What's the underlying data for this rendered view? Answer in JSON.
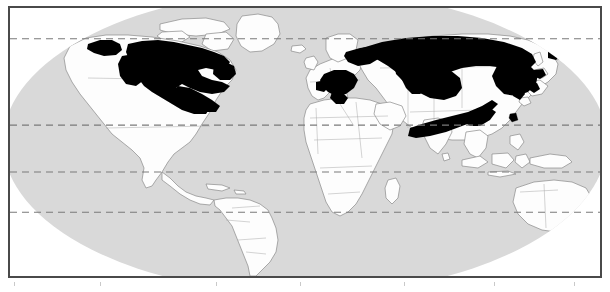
{
  "figure": {
    "kind": "world-distribution-map",
    "projection": "Robinson-like pseudocylindrical ellipse",
    "width_px": 610,
    "height_px": 292
  },
  "colors": {
    "frame_border": "#4a4a4a",
    "ocean_fill": "#d9d9d9",
    "land_fill": "#fdfdfd",
    "land_outline": "#8a8a8a",
    "country_outline": "#a8a8a8",
    "range_fill": "#000000",
    "graticule": "#7a7a7a",
    "page_background": "#ffffff",
    "tick_mark": "#c9c9c9"
  },
  "legend": {
    "range_label": "Distribution range",
    "range_swatch_color": "#000000",
    "land_label": "Land",
    "ocean_label": "Ocean"
  },
  "graticule": {
    "style": "dashed",
    "latitude_lines": [
      {
        "name": "Arctic Circle",
        "y_ratio": 0.115
      },
      {
        "name": "Tropic of Cancer",
        "y_ratio": 0.437
      },
      {
        "name": "Equator",
        "y_ratio": 0.612
      },
      {
        "name": "Tropic of Capricorn",
        "y_ratio": 0.762
      }
    ]
  },
  "range_regions": [
    {
      "name": "Alaska",
      "continent": "North America",
      "present": true
    },
    {
      "name": "Yukon and Northwest Territories",
      "continent": "North America",
      "present": true
    },
    {
      "name": "Boreal Canada",
      "continent": "North America",
      "present": true
    },
    {
      "name": "Eastern Canada and Labrador",
      "continent": "North America",
      "present": true
    },
    {
      "name": "Great Lakes region",
      "continent": "North America",
      "present": true
    },
    {
      "name": "Alps and Carpathians",
      "continent": "Europe",
      "present": true
    },
    {
      "name": "Balkans",
      "continent": "Europe",
      "present": true
    },
    {
      "name": "Scandinavia and European Russia",
      "continent": "Eurasia",
      "present": true
    },
    {
      "name": "Siberia",
      "continent": "Eurasia",
      "present": true
    },
    {
      "name": "Russian Far East",
      "continent": "Eurasia",
      "present": true
    },
    {
      "name": "Himalaya arc",
      "continent": "Asia",
      "present": true
    },
    {
      "name": "Southern China",
      "continent": "Asia",
      "present": true
    },
    {
      "name": "Korean Peninsula",
      "continent": "Asia",
      "present": true
    },
    {
      "name": "Hokkaido, Japan",
      "continent": "Asia",
      "present": true
    },
    {
      "name": "Honshu, Japan",
      "continent": "Asia",
      "present": true
    },
    {
      "name": "Taiwan",
      "continent": "Asia",
      "present": true
    }
  ],
  "absent_regions": [
    "South America",
    "Africa",
    "Australia",
    "New Zealand",
    "Greenland interior",
    "Southern United States",
    "Arabian Peninsula",
    "India"
  ],
  "footer": {
    "tick_count": 7,
    "note": ""
  }
}
